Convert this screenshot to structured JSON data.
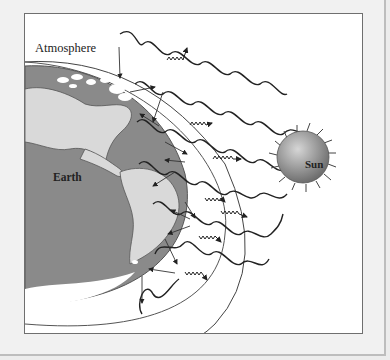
{
  "diagram": {
    "labels": {
      "atmosphere": "Atmosphere",
      "earth": "Earth",
      "sun": "Sun"
    },
    "colors": {
      "ocean": "#8a8a8a",
      "land": "#d9d9d9",
      "ice": "#ffffff",
      "sun_gradient_light": "#d6d6d6",
      "sun_gradient_dark": "#6e6e6e",
      "line": "#222222",
      "frame_bg": "#ffffff",
      "page_bg": "#ececec"
    },
    "elements": [
      "incoming solar radiation (long wavy lines)",
      "outgoing infrared radiation (short squiggly arrows)",
      "atmosphere boundary arc",
      "re-emitted radiation arrows"
    ]
  }
}
